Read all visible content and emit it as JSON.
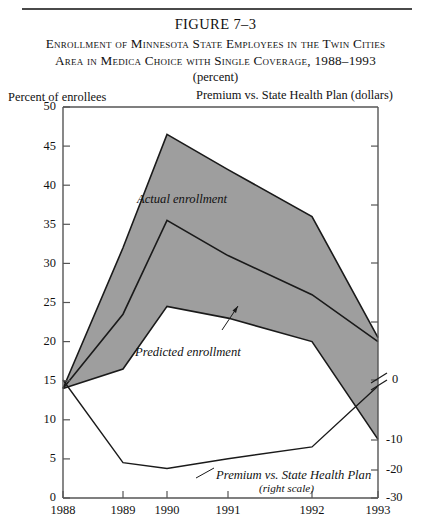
{
  "figure": {
    "number": "FIGURE 7–3",
    "title_line1": "Enrollment of Minnesota State Employees in the Twin Cities",
    "title_line2": "Area in Medica Choice with Single Coverage, 1988–1993",
    "subtitle": "(percent)"
  },
  "axis_titles": {
    "left": "Percent of enrollees",
    "right": "Premium vs. State Health Plan (dollars)"
  },
  "annotations": {
    "actual": "Actual enrollment",
    "predicted": "Predicted enrollment",
    "premium_line1": "Premium vs. State Health Plan",
    "premium_line2": "(right scale)"
  },
  "colors": {
    "band_fill": "#9e9e9e",
    "line": "#1a1a1a",
    "axis": "#555555",
    "background": "#ffffff"
  },
  "chart_data": {
    "type": "area",
    "title": "Enrollment of Minnesota State Employees in the Twin Cities Area in Medica Choice with Single Coverage, 1988–1993",
    "subtitle": "(percent)",
    "xlabel": "",
    "ylabel": "Percent of enrollees",
    "y2label": "Premium vs. State Health Plan (dollars)",
    "x": [
      "1988",
      "1989",
      "1990",
      "1991",
      "1992",
      "1993"
    ],
    "xlim": [
      1988,
      1993
    ],
    "ylim": [
      0,
      50
    ],
    "yticks": [
      0,
      5,
      10,
      15,
      20,
      25,
      30,
      35,
      40,
      45,
      50
    ],
    "y2lim": [
      -30,
      0
    ],
    "y2ticks": [
      -30,
      -20,
      -10,
      0
    ],
    "y2_axis_break": true,
    "grid": false,
    "legend": "none",
    "series": [
      {
        "name": "Actual enrollment upper bound",
        "axis": "left",
        "values": [
          14.0,
          32.0,
          46.5,
          42.0,
          36.0,
          20.5
        ]
      },
      {
        "name": "Actual enrollment",
        "axis": "left",
        "values": [
          14.0,
          23.5,
          35.5,
          31.0,
          26.0,
          20.0
        ]
      },
      {
        "name": "Predicted enrollment",
        "axis": "left",
        "values": [
          14.0,
          16.5,
          24.5,
          23.0,
          20.0,
          7.5
        ]
      },
      {
        "name": "Premium vs. State Health Plan",
        "axis": "right",
        "values": [
          0.0,
          -21.0,
          -22.5,
          -20.0,
          -17.0,
          -1.5
        ]
      }
    ],
    "annotations": [
      {
        "text": "Actual enrollment",
        "x": "1990",
        "y": 37.5
      },
      {
        "text": "Predicted enrollment",
        "x": "1990.6",
        "y": 18.5
      },
      {
        "text": "Premium vs. State Health Plan (right scale)",
        "x": "1991.6",
        "y": 2.5
      }
    ]
  }
}
